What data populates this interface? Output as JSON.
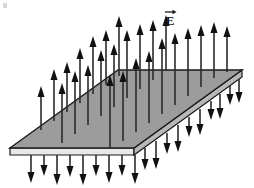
{
  "figure": {
    "domain": "physics-diagram",
    "background_color": "#ffffff",
    "canvas": {
      "width": 254,
      "height": 188
    }
  },
  "labels": {
    "field_label": "E",
    "field_label_vector_accent": "→",
    "field_label_x": 170,
    "field_label_y": 22,
    "field_label_font_size": 13,
    "field_label_color": "#1a1a1a"
  },
  "plane": {
    "name": "charged-plane-slab",
    "fill_color": "#9c9c9c",
    "edge_color": "#1a1a1a",
    "thickness_fill_color": "#e8e8e8",
    "thickness_shade_color": "#b8b8b8",
    "top_face_points": "10,148 118,70 242,70 134,148",
    "front_edge_points": "10,148 134,148 134,155 10,155",
    "right_edge_points": "134,148 242,70 242,77 134,155",
    "vertices": {
      "left": [
        10,
        148
      ],
      "back_left": [
        118,
        70
      ],
      "back_right": [
        242,
        70
      ],
      "front_right": [
        134,
        148
      ]
    },
    "slab_thickness": 7
  },
  "arrows": {
    "shaft_color": "#2b2b2b",
    "head_color": "#111111",
    "shaft_width": 1.6,
    "head_width": 7,
    "head_length": 11,
    "up_direction": "perpendicular-up",
    "down_direction": "perpendicular-down",
    "up_count": 26,
    "down_count": 19,
    "up": [
      {
        "x": 41,
        "base_y": 130,
        "length": 44
      },
      {
        "x": 54,
        "base_y": 121,
        "length": 52
      },
      {
        "x": 67,
        "base_y": 112,
        "length": 50
      },
      {
        "x": 80,
        "base_y": 103,
        "length": 55
      },
      {
        "x": 93,
        "base_y": 94,
        "length": 58
      },
      {
        "x": 106,
        "base_y": 85,
        "length": 55
      },
      {
        "x": 119,
        "base_y": 76,
        "length": 60
      },
      {
        "x": 62,
        "base_y": 143,
        "length": 60
      },
      {
        "x": 75,
        "base_y": 134,
        "length": 63
      },
      {
        "x": 88,
        "base_y": 125,
        "length": 60
      },
      {
        "x": 101,
        "base_y": 116,
        "length": 66
      },
      {
        "x": 114,
        "base_y": 107,
        "length": 63
      },
      {
        "x": 127,
        "base_y": 98,
        "length": 68
      },
      {
        "x": 140,
        "base_y": 89,
        "length": 65
      },
      {
        "x": 153,
        "base_y": 80,
        "length": 60
      },
      {
        "x": 166,
        "base_y": 71,
        "length": 56
      },
      {
        "x": 110,
        "base_y": 147,
        "length": 72
      },
      {
        "x": 123,
        "base_y": 141,
        "length": 70
      },
      {
        "x": 136,
        "base_y": 132,
        "length": 74
      },
      {
        "x": 149,
        "base_y": 123,
        "length": 72
      },
      {
        "x": 162,
        "base_y": 114,
        "length": 76
      },
      {
        "x": 175,
        "base_y": 105,
        "length": 72
      },
      {
        "x": 188,
        "base_y": 96,
        "length": 68
      },
      {
        "x": 201,
        "base_y": 87,
        "length": 62
      },
      {
        "x": 214,
        "base_y": 78,
        "length": 56
      },
      {
        "x": 227,
        "base_y": 72,
        "length": 46
      }
    ],
    "down": [
      {
        "x": 31,
        "base_y": 155,
        "length": 28
      },
      {
        "x": 44,
        "base_y": 155,
        "length": 21
      },
      {
        "x": 57,
        "base_y": 155,
        "length": 30
      },
      {
        "x": 70,
        "base_y": 155,
        "length": 22
      },
      {
        "x": 83,
        "base_y": 155,
        "length": 30
      },
      {
        "x": 96,
        "base_y": 155,
        "length": 21
      },
      {
        "x": 109,
        "base_y": 155,
        "length": 28
      },
      {
        "x": 122,
        "base_y": 155,
        "length": 21
      },
      {
        "x": 135,
        "base_y": 155,
        "length": 29
      },
      {
        "x": 145,
        "base_y": 148,
        "length": 22
      },
      {
        "x": 156,
        "base_y": 141,
        "length": 28
      },
      {
        "x": 167,
        "base_y": 133,
        "length": 21
      },
      {
        "x": 178,
        "base_y": 125,
        "length": 27
      },
      {
        "x": 189,
        "base_y": 117,
        "length": 20
      },
      {
        "x": 200,
        "base_y": 109,
        "length": 26
      },
      {
        "x": 211,
        "base_y": 101,
        "length": 19
      },
      {
        "x": 220,
        "base_y": 94,
        "length": 25
      },
      {
        "x": 230,
        "base_y": 86,
        "length": 19
      },
      {
        "x": 239,
        "base_y": 79,
        "length": 24
      }
    ]
  },
  "artifacts": {
    "corner_mark_x": 3,
    "corner_mark_y": 3,
    "corner_mark_color": "#d8d8d8"
  }
}
